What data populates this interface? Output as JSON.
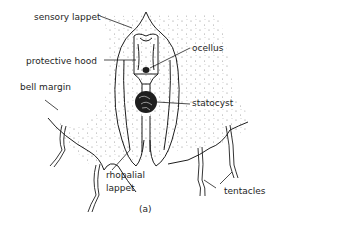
{
  "diagram": {
    "caption": "(a)",
    "labels": {
      "sensory_lappet": "sensory lappet",
      "protective_hood": "protective hood",
      "bell_margin": "bell margin",
      "ocellus": "ocellus",
      "statocyst": "statocyst",
      "rhopalial_lappet_line1": "rhopalial",
      "rhopalial_lappet_line2": "lappet",
      "tentacles": "tentacles"
    },
    "colors": {
      "ink": "#1e1e1e",
      "background": "#ffffff",
      "stipple": "#8a8a8a"
    }
  }
}
